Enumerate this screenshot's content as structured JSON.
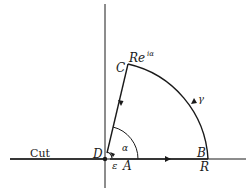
{
  "diagram": {
    "type": "contour-integral",
    "labels": {
      "cut": "Cut",
      "D": "D",
      "C": "C",
      "B": "B",
      "R": "R",
      "A": "A",
      "epsilon": "ε",
      "alpha": "α",
      "gamma": "γ",
      "Re": "Re",
      "exponent": "iα"
    },
    "colors": {
      "stroke": "#1a1a1a",
      "background": "#ffffff"
    }
  }
}
